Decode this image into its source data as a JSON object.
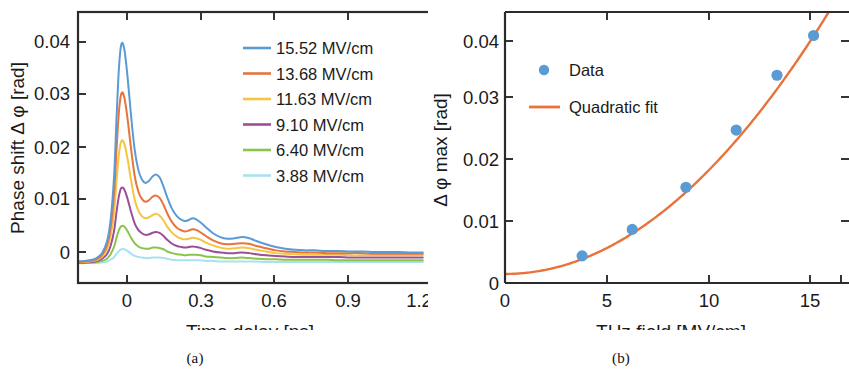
{
  "figure": {
    "panels": [
      {
        "id": "a",
        "sublabel": "(a)"
      },
      {
        "id": "b",
        "sublabel": "(b)"
      }
    ]
  },
  "panel_a": {
    "sublabel": "(a)",
    "xlabel": "Time delay [ps]",
    "ylabel": "Phase shift Δ φ [rad]",
    "xticklabels": [
      "0",
      "0.3",
      "0.6",
      "0.9",
      "1.2"
    ],
    "yticklabels": [
      "0",
      "0.01",
      "0.02",
      "0.03",
      "0.04"
    ],
    "legend": [
      {
        "label": "15.52 MV/cm",
        "color": "#5b9bd5"
      },
      {
        "label": "13.68 MV/cm",
        "color": "#e8743b"
      },
      {
        "label": "11.63 MV/cm",
        "color": "#f5c542"
      },
      {
        "label": "9.10  MV/cm",
        "color": "#9b4f96"
      },
      {
        "label": "6.40  MV/cm",
        "color": "#8ac44a"
      },
      {
        "label": "3.88  MV/cm",
        "color": "#a8e2f0"
      }
    ]
  },
  "panel_b": {
    "sublabel": "(b)",
    "xlabel": "THz field [MV/cm]",
    "ylabel": "Δ φ max [rad]",
    "xticklabels": [
      "0",
      "5",
      "10",
      "15"
    ],
    "yticklabels": [
      "0",
      "0.01",
      "0.02",
      "0.03",
      "0.04"
    ],
    "legend": [
      {
        "label": "Data",
        "color": "#5b9bd5",
        "marker": "circle"
      },
      {
        "label": "Quadratic fit",
        "color": "#e8743b",
        "marker": "line"
      }
    ]
  },
  "chart_data": [
    {
      "type": "line",
      "panel": "a",
      "title": "",
      "xlabel": "Time delay [ps]",
      "ylabel": "Phase shift Δ φ [rad]",
      "xlim": [
        -0.18,
        1.28
      ],
      "ylim": [
        -0.0035,
        0.0455
      ],
      "xticks": [
        0,
        0.3,
        0.6,
        0.9,
        1.2
      ],
      "yticks": [
        0,
        0.01,
        0.02,
        0.03,
        0.04
      ],
      "grid": false,
      "legend_position": "upper-right",
      "x": [
        -0.18,
        -0.15,
        -0.12,
        -0.1,
        -0.08,
        -0.06,
        -0.045,
        -0.03,
        -0.02,
        -0.01,
        0.0,
        0.012,
        0.025,
        0.04,
        0.055,
        0.07,
        0.085,
        0.1,
        0.115,
        0.13,
        0.145,
        0.16,
        0.175,
        0.19,
        0.21,
        0.23,
        0.25,
        0.265,
        0.28,
        0.295,
        0.31,
        0.33,
        0.35,
        0.38,
        0.41,
        0.44,
        0.47,
        0.5,
        0.53,
        0.56,
        0.6,
        0.64,
        0.68,
        0.72,
        0.76,
        0.8,
        0.85,
        0.9,
        0.95,
        1.0,
        1.05,
        1.1,
        1.15,
        1.2,
        1.25
      ],
      "series": [
        {
          "name": "15.52 MV/cm",
          "color": "#5b9bd5",
          "peak": 0.0397,
          "values": [
            0.0004,
            0.0005,
            0.0007,
            0.0011,
            0.0019,
            0.004,
            0.0078,
            0.016,
            0.0265,
            0.0355,
            0.0397,
            0.0388,
            0.034,
            0.0268,
            0.0206,
            0.017,
            0.0152,
            0.0146,
            0.015,
            0.0158,
            0.0161,
            0.0155,
            0.0139,
            0.012,
            0.0099,
            0.0086,
            0.0079,
            0.0077,
            0.0079,
            0.0082,
            0.008,
            0.0074,
            0.0066,
            0.0055,
            0.0048,
            0.0045,
            0.0046,
            0.0048,
            0.0046,
            0.0041,
            0.0035,
            0.003,
            0.0027,
            0.0025,
            0.0024,
            0.0024,
            0.0023,
            0.0023,
            0.0022,
            0.0022,
            0.0021,
            0.0021,
            0.0021,
            0.002,
            0.002
          ]
        },
        {
          "name": "13.68 MV/cm",
          "color": "#e8743b",
          "peak": 0.0308,
          "values": [
            0.0003,
            0.0004,
            0.0006,
            0.0009,
            0.0016,
            0.0033,
            0.0064,
            0.0128,
            0.0208,
            0.0276,
            0.0308,
            0.0301,
            0.0264,
            0.0208,
            0.0159,
            0.0131,
            0.0117,
            0.0112,
            0.0115,
            0.0121,
            0.0123,
            0.0118,
            0.0106,
            0.0091,
            0.0075,
            0.0065,
            0.006,
            0.0058,
            0.006,
            0.0062,
            0.0061,
            0.0056,
            0.005,
            0.0042,
            0.0037,
            0.0035,
            0.0036,
            0.0037,
            0.0036,
            0.0032,
            0.0028,
            0.0024,
            0.0022,
            0.0021,
            0.002,
            0.002,
            0.0019,
            0.0019,
            0.0019,
            0.0019,
            0.0018,
            0.0018,
            0.0018,
            0.0018,
            0.0018
          ]
        },
        {
          "name": "11.63 MV/cm",
          "color": "#f5c542",
          "peak": 0.0222,
          "values": [
            0.0003,
            0.0003,
            0.0005,
            0.0007,
            0.0013,
            0.0026,
            0.0049,
            0.0095,
            0.0151,
            0.0199,
            0.0222,
            0.0217,
            0.0191,
            0.0151,
            0.0116,
            0.0096,
            0.0086,
            0.0082,
            0.0084,
            0.0088,
            0.009,
            0.0086,
            0.0078,
            0.0067,
            0.0056,
            0.0049,
            0.0045,
            0.0044,
            0.0045,
            0.0047,
            0.0046,
            0.0043,
            0.0038,
            0.0033,
            0.0029,
            0.0027,
            0.0028,
            0.0029,
            0.0028,
            0.0025,
            0.0022,
            0.0019,
            0.0018,
            0.0017,
            0.0016,
            0.0016,
            0.0016,
            0.0016,
            0.0015,
            0.0015,
            0.0015,
            0.0015,
            0.0015,
            0.0015,
            0.0015
          ]
        },
        {
          "name": "9.10 MV/cm",
          "color": "#9b4f96",
          "peak": 0.0137,
          "values": [
            0.0002,
            0.0002,
            0.0003,
            0.0005,
            0.0009,
            0.0017,
            0.0032,
            0.006,
            0.0094,
            0.0123,
            0.0137,
            0.0134,
            0.0118,
            0.0094,
            0.0073,
            0.0061,
            0.0055,
            0.0052,
            0.0053,
            0.0056,
            0.0057,
            0.0055,
            0.005,
            0.0043,
            0.0036,
            0.0032,
            0.003,
            0.0029,
            0.003,
            0.0031,
            0.003,
            0.0028,
            0.0025,
            0.0022,
            0.002,
            0.0019,
            0.0019,
            0.002,
            0.0019,
            0.0017,
            0.0015,
            0.0014,
            0.0013,
            0.0012,
            0.0012,
            0.0012,
            0.0012,
            0.0012,
            0.0011,
            0.0011,
            0.0011,
            0.0011,
            0.0011,
            0.0011,
            0.0011
          ]
        },
        {
          "name": "6.40 MV/cm",
          "color": "#8ac44a",
          "peak": 0.0068,
          "values": [
            0.0001,
            0.0001,
            0.0002,
            0.0003,
            0.0005,
            0.0009,
            0.0017,
            0.0031,
            0.0047,
            0.0061,
            0.0068,
            0.0067,
            0.0059,
            0.0047,
            0.0037,
            0.0031,
            0.0028,
            0.0027,
            0.0027,
            0.0029,
            0.0029,
            0.0028,
            0.0026,
            0.0022,
            0.0019,
            0.0017,
            0.0016,
            0.0015,
            0.0016,
            0.0016,
            0.0016,
            0.0015,
            0.0013,
            0.0012,
            0.0011,
            0.001,
            0.001,
            0.0011,
            0.001,
            0.0009,
            0.0008,
            0.0008,
            0.0007,
            0.0007,
            0.0007,
            0.0007,
            0.0007,
            0.0006,
            0.0006,
            0.0006,
            0.0006,
            0.0006,
            0.0006,
            0.0006,
            0.0006
          ]
        },
        {
          "name": "3.88 MV/cm",
          "color": "#a8e2f0",
          "peak": 0.0026,
          "values": [
            0.0001,
            0.0001,
            0.0001,
            0.0001,
            0.0002,
            0.0004,
            0.0007,
            0.0012,
            0.0018,
            0.0023,
            0.0026,
            0.0026,
            0.0023,
            0.0018,
            0.0014,
            0.0012,
            0.0011,
            0.001,
            0.001,
            0.0011,
            0.0011,
            0.0011,
            0.001,
            0.0009,
            0.0007,
            0.0006,
            0.0006,
            0.0006,
            0.0006,
            0.0006,
            0.0006,
            0.0006,
            0.0005,
            0.0005,
            0.0004,
            0.0004,
            0.0004,
            0.0004,
            0.0004,
            0.0004,
            0.0003,
            0.0003,
            0.0003,
            0.0003,
            0.0003,
            0.0003,
            0.0003,
            0.0003,
            0.0003,
            0.0003,
            0.0003,
            0.0003,
            0.0003,
            0.0003,
            0.0003
          ]
        }
      ]
    },
    {
      "type": "scatter",
      "panel": "b",
      "title": "",
      "xlabel": "THz field [MV/cm]",
      "ylabel": "Δ φ max [rad]",
      "xlim": [
        0,
        16.9
      ],
      "ylim": [
        -0.0015,
        0.0435
      ],
      "xticks": [
        0,
        5,
        10,
        15
      ],
      "yticks": [
        0,
        0.01,
        0.02,
        0.03,
        0.04
      ],
      "grid": false,
      "legend_position": "upper-left",
      "series": [
        {
          "name": "Data",
          "color": "#5b9bd5",
          "marker": "circle",
          "x": [
            3.88,
            6.4,
            9.1,
            11.63,
            13.68,
            15.52
          ],
          "y": [
            0.003,
            0.0074,
            0.0144,
            0.0239,
            0.033,
            0.0396
          ]
        },
        {
          "name": "Quadratic fit",
          "color": "#e8743b",
          "marker": "line",
          "coefficients": {
            "a": 0.000164,
            "b": 0.0,
            "c": 0.0
          },
          "equation": "y = 0.000164 x^2"
        }
      ]
    }
  ]
}
